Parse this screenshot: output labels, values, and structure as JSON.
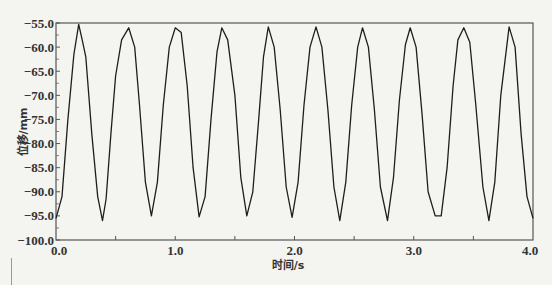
{
  "chart_data": {
    "type": "line",
    "title": "",
    "xlabel": "时间/s",
    "ylabel": "位移/mm",
    "xlim": [
      0.0,
      4.0
    ],
    "ylim": [
      -100.0,
      -55.0
    ],
    "grid": false,
    "legend": null,
    "x_ticks": [
      "0.0",
      "1.0",
      "2.0",
      "3.0",
      "4.0"
    ],
    "y_ticks": [
      "-55.0",
      "-60.0",
      "-65.0",
      "-70.0",
      "-75.0",
      "-80.0",
      "-85.0",
      "-90.0",
      "-95.0",
      "-100.0"
    ],
    "series": [
      {
        "name": "displacement",
        "x": [
          0.0,
          0.05,
          0.1,
          0.15,
          0.19,
          0.22,
          0.25,
          0.3,
          0.35,
          0.39,
          0.42,
          0.46,
          0.5,
          0.55,
          0.61,
          0.66,
          0.7,
          0.75,
          0.8,
          0.85,
          0.9,
          0.95,
          1.0,
          1.05,
          1.1,
          1.15,
          1.2,
          1.25,
          1.3,
          1.35,
          1.39,
          1.44,
          1.5,
          1.55,
          1.6,
          1.65,
          1.7,
          1.74,
          1.78,
          1.83,
          1.88,
          1.93,
          1.98,
          2.03,
          2.08,
          2.13,
          2.18,
          2.23,
          2.28,
          2.33,
          2.38,
          2.43,
          2.48,
          2.53,
          2.57,
          2.62,
          2.67,
          2.72,
          2.78,
          2.83,
          2.88,
          2.93,
          2.97,
          3.02,
          3.07,
          3.12,
          3.18,
          3.23,
          3.28,
          3.33,
          3.37,
          3.42,
          3.47,
          3.52,
          3.58,
          3.63,
          3.68,
          3.73,
          3.8,
          3.85,
          3.9,
          3.95,
          4.0
        ],
        "y": [
          -95.5,
          -91.0,
          -75.0,
          -61.5,
          -55.3,
          -58.5,
          -62.0,
          -78.0,
          -91.0,
          -96.0,
          -91.5,
          -78.0,
          -66.0,
          -58.5,
          -56.0,
          -60.0,
          -72.0,
          -88.0,
          -95.0,
          -88.0,
          -72.0,
          -60.0,
          -56.0,
          -57.0,
          -68.0,
          -85.0,
          -95.2,
          -91.0,
          -75.0,
          -61.0,
          -56.0,
          -58.5,
          -70.0,
          -87.0,
          -95.0,
          -90.0,
          -75.0,
          -62.0,
          -55.8,
          -60.0,
          -73.0,
          -89.0,
          -95.3,
          -88.0,
          -72.0,
          -60.0,
          -55.8,
          -60.0,
          -73.0,
          -89.0,
          -96.0,
          -88.0,
          -72.0,
          -60.0,
          -56.0,
          -60.0,
          -73.0,
          -89.0,
          -96.0,
          -87.0,
          -71.0,
          -59.5,
          -56.0,
          -60.0,
          -74.0,
          -90.0,
          -95.0,
          -95.0,
          -85.0,
          -68.0,
          -58.5,
          -56.0,
          -59.0,
          -72.0,
          -89.0,
          -96.0,
          -88.0,
          -70.0,
          -55.8,
          -60.0,
          -78.0,
          -91.0,
          -95.5
        ]
      }
    ]
  },
  "colors": {
    "line": "#1e1e1e",
    "axis": "#555555",
    "background": "#f4f4f1"
  }
}
